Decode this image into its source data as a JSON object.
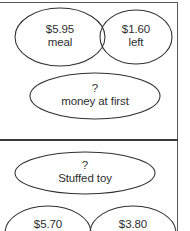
{
  "page": {
    "background_color": "#ffffff",
    "stroke_color": "#2f2f31",
    "text_color": "#2e2e30",
    "divider_color": "#3a3a3c",
    "frame_color": "#58585a"
  },
  "problems": [
    {
      "id": "problem-money",
      "whole": {
        "name": "whole-node-money",
        "value": "?",
        "label": "money at first"
      },
      "parts": [
        {
          "name": "part-node-meal",
          "value": "$5.95",
          "label": "meal"
        },
        {
          "name": "part-node-left",
          "value": "$1.60",
          "label": "left"
        }
      ]
    },
    {
      "id": "problem-stuffed-toy",
      "whole": {
        "name": "whole-node-stuffed-toy",
        "value": "?",
        "label": "Stuffed toy"
      },
      "parts": [
        {
          "name": "part-node-570",
          "value": "$5.70",
          "label": ""
        },
        {
          "name": "part-node-380",
          "value": "$3.80",
          "label": ""
        }
      ]
    }
  ]
}
